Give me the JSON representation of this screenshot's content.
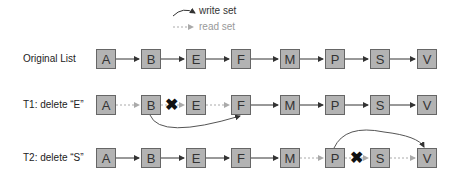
{
  "legend": {
    "write_label": "write set",
    "read_label": "read set"
  },
  "rows": [
    {
      "label": "Original List",
      "nodes": [
        "A",
        "B",
        "E",
        "F",
        "M",
        "P",
        "S",
        "V"
      ]
    },
    {
      "label": "T1: delete “E”",
      "nodes": [
        "A",
        "B",
        "E",
        "F",
        "M",
        "P",
        "S",
        "V"
      ]
    },
    {
      "label": "T2: delete “S”",
      "nodes": [
        "A",
        "B",
        "E",
        "F",
        "M",
        "P",
        "S",
        "V"
      ]
    }
  ],
  "marks": {
    "x": "✖"
  },
  "colors": {
    "node_fill": "#b3b3b3",
    "node_border": "#666666",
    "write_arrow": "#333333",
    "read_arrow": "#aaaaaa"
  }
}
